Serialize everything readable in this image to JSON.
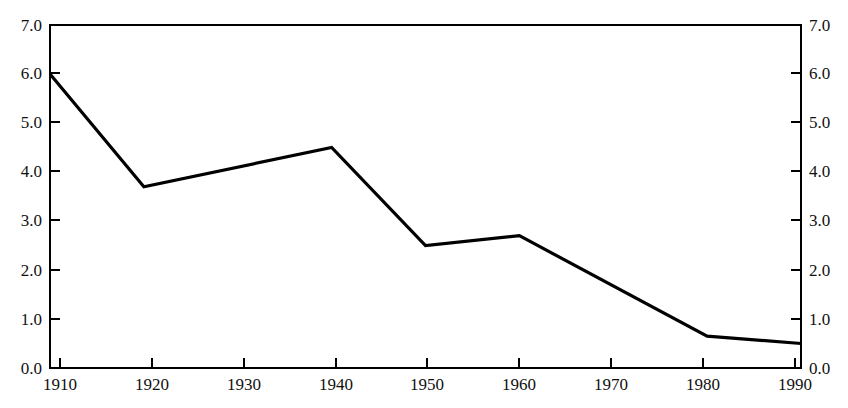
{
  "chart_data": {
    "type": "line",
    "title": "",
    "subtitle": "",
    "xlabel": "",
    "ylabel": "",
    "x": [
      1910,
      1920,
      1930,
      1940,
      1950,
      1960,
      1970,
      1980,
      1990
    ],
    "values": [
      6.0,
      3.7,
      4.1,
      4.5,
      2.5,
      2.7,
      1.65,
      0.65,
      0.5
    ],
    "series": [
      {
        "name": "",
        "x": [
          1910,
          1920,
          1940,
          1950,
          1960,
          1980,
          1990
        ],
        "values": [
          6.0,
          3.7,
          4.5,
          2.5,
          2.7,
          0.65,
          0.5
        ],
        "color": "#000000"
      }
    ],
    "xlim": [
      1910,
      1990
    ],
    "ylim": [
      0.0,
      7.0
    ],
    "xticks": [
      1910,
      1920,
      1930,
      1940,
      1950,
      1960,
      1970,
      1980,
      1990
    ],
    "yticks": [
      0.0,
      1.0,
      2.0,
      3.0,
      4.0,
      5.0,
      6.0,
      7.0
    ],
    "xtick_labels": [
      "1910",
      "1920",
      "1930",
      "1940",
      "1950",
      "1960",
      "1970",
      "1980",
      "1990"
    ],
    "ytick_labels": [
      "0.0",
      "1.0",
      "2.0",
      "3.0",
      "4.0",
      "5.0",
      "6.0",
      "7.0"
    ],
    "right_axis_labels": [
      "0.0",
      "1.0",
      "2.0",
      "3.0",
      "4.0",
      "5.0",
      "6.0",
      "7.0"
    ],
    "grid": false,
    "legend": false,
    "legend_position": "none",
    "annotations": [],
    "line_color": "#000000",
    "axis_color": "#000000",
    "background_color": "#ffffff"
  },
  "axes": {
    "left": {
      "label_0": "0.0",
      "label_1": "1.0",
      "label_2": "2.0",
      "label_3": "3.0",
      "label_4": "4.0",
      "label_5": "5.0",
      "label_6": "6.0",
      "label_7": "7.0"
    },
    "right": {
      "label_0": "0.0",
      "label_1": "1.0",
      "label_2": "2.0",
      "label_3": "3.0",
      "label_4": "4.0",
      "label_5": "5.0",
      "label_6": "6.0",
      "label_7": "7.0"
    },
    "bottom": {
      "label_1910": "1910",
      "label_1920": "1920",
      "label_1930": "1930",
      "label_1940": "1940",
      "label_1950": "1950",
      "label_1960": "1960",
      "label_1970": "1970",
      "label_1980": "1980",
      "label_1990": "1990"
    }
  }
}
